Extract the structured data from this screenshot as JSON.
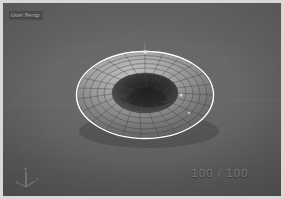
{
  "app": {
    "title": "3D Viewport",
    "background_color": "#5f5f5f",
    "frame_color": "#d8d8d8"
  },
  "viewport": {
    "name": "perspective-viewport",
    "shading_mode": "solid-wireframe",
    "grid_color": "#6d6d6d",
    "grid_accent_color": "#7a7a7a"
  },
  "hud": {
    "header_label": "User Persp",
    "counter": "100 / 100",
    "counter_color": "#969696",
    "header_color": "#d2d2d2"
  },
  "object": {
    "name": "Torus",
    "type": "mesh",
    "selected": true,
    "outline_color": "#ffffff",
    "surface_light": "#b9b9b9",
    "surface_mid": "#8a8a8a",
    "surface_dark": "#4a4a4a",
    "wire_color": "#3c3c3c",
    "segments_major": 24,
    "segments_minor": 12
  },
  "gizmo": {
    "name": "axis-gizmo",
    "axes": [
      {
        "label": "X",
        "color": "#9a9a9a"
      },
      {
        "label": "Y",
        "color": "#a6a6a6"
      },
      {
        "label": "Z",
        "color": "#bdbdbd"
      }
    ]
  }
}
